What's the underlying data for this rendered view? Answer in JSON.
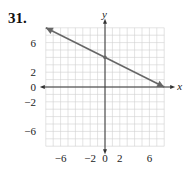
{
  "problem_number": "31.",
  "chart_data": {
    "type": "line",
    "title": "",
    "xlabel": "x",
    "ylabel": "y",
    "xlim": [
      -8,
      8
    ],
    "ylim": [
      -8,
      8
    ],
    "grid": true,
    "x_tick_labels": [
      "-6",
      "-2",
      "0",
      "2",
      "6"
    ],
    "y_tick_labels": [
      "6",
      "2",
      "0",
      "-2",
      "-6"
    ],
    "series": [
      {
        "name": "line",
        "equation": "y = -x/2 + 4",
        "x": [
          -8,
          0,
          8
        ],
        "y": [
          8,
          4,
          0
        ],
        "marked_points": [
          [
            0,
            4
          ]
        ],
        "arrows_at_ends": true
      }
    ]
  },
  "colors": {
    "line": "#666666",
    "grid": "#d0d0d0",
    "axis": "#333333"
  }
}
